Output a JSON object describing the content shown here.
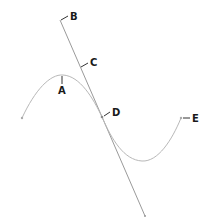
{
  "diagram": {
    "colors": {
      "curve": "#b0b0b0",
      "tangent_line": "#9a9a9a",
      "tick": "#333333",
      "label": "#1a1a1a",
      "background": "#ffffff"
    },
    "labels": {
      "a": "A",
      "b": "B",
      "c": "C",
      "d": "D",
      "e": "E"
    }
  }
}
